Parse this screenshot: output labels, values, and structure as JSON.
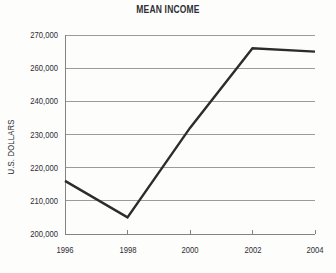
{
  "chart_data": {
    "type": "line",
    "title": "MEAN INCOME",
    "ylabel": "U.S. DOLLARS",
    "xlabel": "",
    "x": [
      1996,
      1998,
      2000,
      2002,
      2004
    ],
    "x_tick_labels": [
      "1996",
      "1998",
      "2000",
      "2002",
      "2004"
    ],
    "values": [
      216000,
      205000,
      232000,
      266000,
      265000
    ],
    "y_tick_values": [
      200000,
      210000,
      220000,
      230000,
      240000,
      260000,
      270000
    ],
    "y_tick_labels": [
      "200,000",
      "210,000",
      "220,000",
      "230,000",
      "240,000",
      "260,000",
      "270,000"
    ],
    "ylim": [
      200000,
      270000
    ],
    "grid": true,
    "legend": "none",
    "axis_note": "Gridlines evenly spaced but the 250,000 step is skipped (broken scale)",
    "colors": {
      "line": "#2c2c2c",
      "grid": "#9b9b9b",
      "axis": "#838383",
      "text": "#2c2c33",
      "background": "#fdfdfc"
    }
  }
}
